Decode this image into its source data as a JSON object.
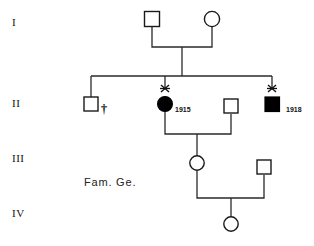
{
  "figure": {
    "kind": "pedigree-chart",
    "family_label": "Fam. Ge.",
    "background_color": "#ffffff",
    "line_color": "#2a2a2a",
    "affected_color": "#000000",
    "unaffected_color": "#ffffff"
  },
  "generations": [
    {
      "label": "I",
      "y": 22
    },
    {
      "label": "II",
      "y": 103
    },
    {
      "label": "III",
      "y": 158
    },
    {
      "label": "IV",
      "y": 213
    }
  ],
  "individuals": [
    {
      "id": "I-1",
      "generation": "I",
      "sex": "male",
      "shape": "square",
      "affected": false,
      "x": 152,
      "y": 19,
      "marks": [],
      "year": ""
    },
    {
      "id": "I-2",
      "generation": "I",
      "sex": "female",
      "shape": "circle",
      "affected": false,
      "x": 212,
      "y": 19,
      "marks": [],
      "year": ""
    },
    {
      "id": "II-1",
      "generation": "II",
      "sex": "male",
      "shape": "square",
      "affected": false,
      "x": 91,
      "y": 104,
      "marks": [
        "dagger"
      ],
      "year": ""
    },
    {
      "id": "II-2",
      "generation": "II",
      "sex": "female",
      "shape": "circle",
      "affected": true,
      "x": 165,
      "y": 104,
      "marks": [
        "x-mark"
      ],
      "year": "1915"
    },
    {
      "id": "II-3",
      "generation": "II",
      "sex": "male",
      "shape": "square",
      "affected": false,
      "x": 231,
      "y": 106,
      "marks": [],
      "year": ""
    },
    {
      "id": "II-4",
      "generation": "II",
      "sex": "male",
      "shape": "square",
      "affected": true,
      "x": 272,
      "y": 104,
      "marks": [
        "x-mark"
      ],
      "year": "1918"
    },
    {
      "id": "III-1",
      "generation": "III",
      "sex": "female",
      "shape": "circle",
      "affected": false,
      "x": 197,
      "y": 163,
      "marks": [],
      "year": ""
    },
    {
      "id": "III-2",
      "generation": "III",
      "sex": "male",
      "shape": "square",
      "affected": false,
      "x": 264,
      "y": 167,
      "marks": [],
      "year": ""
    },
    {
      "id": "IV-1",
      "generation": "IV",
      "sex": "female",
      "shape": "circle",
      "affected": false,
      "x": 231,
      "y": 224,
      "marks": [],
      "year": ""
    }
  ],
  "unions": [
    {
      "id": "union-I",
      "partners": [
        "I-1",
        "I-2"
      ],
      "children": [
        "II-1",
        "II-2",
        "II-4"
      ]
    },
    {
      "id": "union-II",
      "partners": [
        "II-2",
        "II-3"
      ],
      "children": [
        "III-1"
      ]
    },
    {
      "id": "union-III",
      "partners": [
        "III-1",
        "III-2"
      ],
      "children": [
        "IV-1"
      ]
    }
  ],
  "legend_symbols": {
    "open_square": "unaffected male",
    "open_circle": "unaffected female",
    "filled_square": "affected male",
    "filled_circle": "affected female",
    "x-mark": "proband / examined marker",
    "dagger": "deceased"
  }
}
